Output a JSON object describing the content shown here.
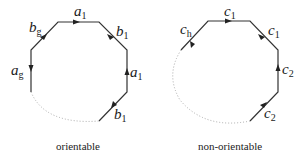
{
  "diagrams": [
    {
      "name": "orientable",
      "caption": "orientable",
      "edges": [
        {
          "label": "a",
          "sub": "1",
          "position": "top"
        },
        {
          "label": "b",
          "sub": "1",
          "position": "upper-right"
        },
        {
          "label": "a",
          "sub": "1",
          "position": "right"
        },
        {
          "label": "b",
          "sub": "1",
          "position": "lower-right"
        },
        {
          "label": "a",
          "sub": "g",
          "position": "left"
        },
        {
          "label": "b",
          "sub": "g",
          "position": "upper-left"
        }
      ]
    },
    {
      "name": "non-orientable",
      "caption": "non-orientable",
      "edges": [
        {
          "label": "c",
          "sub": "1",
          "position": "top"
        },
        {
          "label": "c",
          "sub": "1",
          "position": "upper-right"
        },
        {
          "label": "c",
          "sub": "2",
          "position": "right"
        },
        {
          "label": "c",
          "sub": "2",
          "position": "lower-right"
        },
        {
          "label": "c",
          "sub": "h",
          "position": "upper-left"
        }
      ]
    }
  ],
  "colors": {
    "edge": "#333333",
    "dotted": "#aaaaaa"
  }
}
